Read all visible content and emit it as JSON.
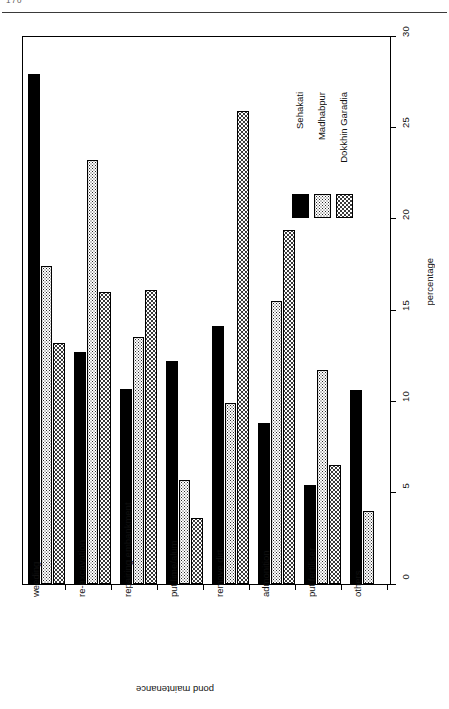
{
  "page": {
    "number": "170"
  },
  "chart_data": {
    "type": "bar",
    "title": "",
    "xlabel": "pond maintenance",
    "ylabel": "percentage",
    "ylim": [
      0,
      30
    ],
    "yticks": [
      0,
      5,
      10,
      15,
      20,
      25,
      30
    ],
    "ytick_labels": [
      "0",
      "5",
      "10",
      "15",
      "20",
      "25",
      "30"
    ],
    "grid": false,
    "orientation": "rotated-90",
    "legend_position": "upper-right",
    "categories": [
      "weeding",
      "re-excavation",
      "repairing embankment",
      "put lime/alum",
      "remove dirt",
      "admonition",
      "put fertiliser",
      "others"
    ],
    "series": [
      {
        "name": "Sehakati",
        "fill": "solid-black",
        "color": "#000000",
        "values": [
          27.9,
          12.7,
          10.7,
          12.2,
          14.1,
          8.8,
          5.4,
          10.6
        ]
      },
      {
        "name": "Madhabpur",
        "fill": "dense-dotted",
        "color": "#2b2b2b",
        "values": [
          17.4,
          23.2,
          13.5,
          5.7,
          9.9,
          15.5,
          11.7,
          4.0
        ]
      },
      {
        "name": "Dokkhin Garadia",
        "fill": "light-dotted",
        "color": "#3a3a3a",
        "values": [
          13.2,
          16.0,
          16.1,
          3.6,
          25.9,
          19.4,
          6.5,
          0
        ]
      }
    ]
  }
}
